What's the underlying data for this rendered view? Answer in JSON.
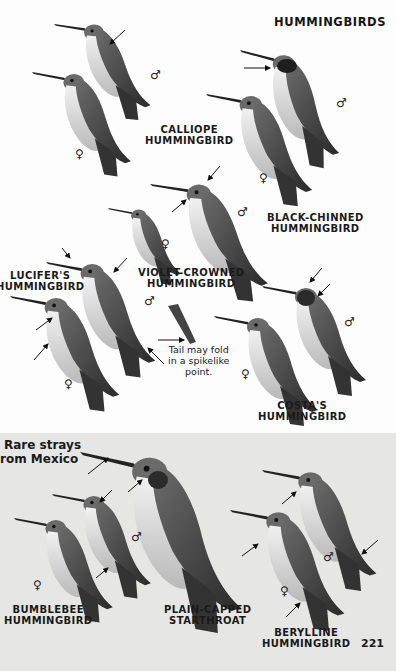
{
  "page": {
    "title": "HUMMINGBIRDS",
    "page_number": "221",
    "background_color": "#fdfdfd",
    "rare_panel_color": "#e6e6e4"
  },
  "species": [
    {
      "name_line1": "CALLIOPE",
      "name_line2": "HUMMINGBIRD",
      "symbols": [
        "♂",
        "♀"
      ]
    },
    {
      "name_line1": "BLACK-CHINNED",
      "name_line2": "HUMMINGBIRD",
      "symbols": [
        "♂",
        "♀"
      ]
    },
    {
      "name_line1": "LUCIFER'S",
      "name_line2": "HUMMINGBIRD",
      "symbols": [
        "♂",
        "♀"
      ]
    },
    {
      "name_line1": "VIOLET-CROWNED",
      "name_line2": "HUMMINGBIRD",
      "symbols": [
        "♂",
        "♀"
      ]
    },
    {
      "name_line1": "COSTA'S",
      "name_line2": "HUMMINGBIRD",
      "symbols": [
        "♂",
        "♀"
      ]
    }
  ],
  "tail_note": {
    "line1": "Tail may fold",
    "line2": "in a spikelike",
    "line3": "point."
  },
  "rare_section": {
    "heading_line1": "Rare strays",
    "heading_line2": "rom Mexico",
    "species": [
      {
        "name_line1": "BUMBLEBEE",
        "name_line2": "HUMMINGBIRD",
        "symbols": [
          "♂",
          "♀"
        ]
      },
      {
        "name_line1": "PLAIN-CAPPED",
        "name_line2": "STARTHROAT"
      },
      {
        "name_line1": "BERYLLINE",
        "name_line2": "HUMMINGBIRD",
        "symbols": [
          "♂",
          "♀"
        ]
      }
    ]
  },
  "symbols": {
    "male": "♂",
    "female": "♀"
  }
}
